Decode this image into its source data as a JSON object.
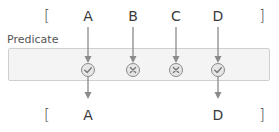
{
  "diagram": {
    "predicate_label": "Predicate",
    "input": {
      "open_bracket": "[",
      "close_bracket": "]",
      "items": [
        {
          "label": "A",
          "x": 88,
          "passes": true
        },
        {
          "label": "B",
          "x": 133,
          "passes": false
        },
        {
          "label": "C",
          "x": 176,
          "passes": false
        },
        {
          "label": "D",
          "x": 218,
          "passes": true
        }
      ]
    },
    "output": {
      "open_bracket": "[",
      "close_bracket": "]",
      "items": [
        {
          "label": "A",
          "x": 88
        },
        {
          "label": "D",
          "x": 218
        }
      ]
    },
    "icons": {
      "pass": "check-circle-icon",
      "fail": "x-circle-icon"
    },
    "colors": {
      "arrow": "#8a8a8a",
      "box_fill": "#f4f4f4",
      "box_border": "#cfcfcf",
      "icon_fill": "#e6e6e6",
      "icon_stroke": "#8a8a8a",
      "text": "#3a3a3a"
    }
  }
}
